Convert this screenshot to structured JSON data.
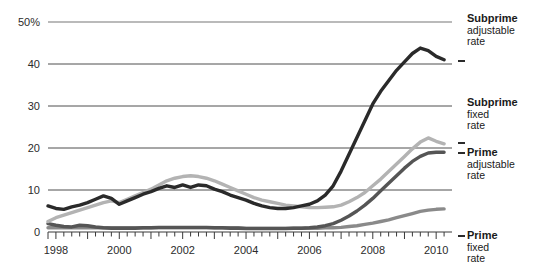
{
  "chart_data": {
    "type": "line",
    "title": "",
    "xlabel": "",
    "ylabel": "",
    "xlim": [
      1997.75,
      2010.5
    ],
    "ylim": [
      0,
      50
    ],
    "grid": true,
    "grid_axis": "y",
    "legend_position": "right",
    "y_ticks": [
      0,
      10,
      20,
      30,
      40,
      50
    ],
    "y_tick_labels": [
      "0",
      "10",
      "20",
      "30",
      "40",
      "50%"
    ],
    "x_ticks": [
      1998,
      2000,
      2002,
      2004,
      2006,
      2008,
      2010
    ],
    "x_tick_labels": [
      "1998",
      "2000",
      "2002",
      "2004",
      "2006",
      "2008",
      "2010"
    ],
    "x_minor_tick_interval": 0.25,
    "x": [
      1997.75,
      1998.0,
      1998.25,
      1998.5,
      1998.75,
      1999.0,
      1999.25,
      1999.5,
      1999.75,
      2000.0,
      2000.25,
      2000.5,
      2000.75,
      2001.0,
      2001.25,
      2001.5,
      2001.75,
      2002.0,
      2002.25,
      2002.5,
      2002.75,
      2003.0,
      2003.25,
      2003.5,
      2003.75,
      2004.0,
      2004.25,
      2004.5,
      2004.75,
      2005.0,
      2005.25,
      2005.5,
      2005.75,
      2006.0,
      2006.25,
      2006.5,
      2006.75,
      2007.0,
      2007.25,
      2007.5,
      2007.75,
      2008.0,
      2008.25,
      2008.5,
      2008.75,
      2009.0,
      2009.25,
      2009.5,
      2009.75,
      2010.0,
      2010.25
    ],
    "series": [
      {
        "name": "Subprime adjustable rate",
        "color": "#2a2a2a",
        "values": [
          6.2,
          5.6,
          5.4,
          6.0,
          6.4,
          7.0,
          7.8,
          8.6,
          8.0,
          6.6,
          7.4,
          8.2,
          9.0,
          9.6,
          10.4,
          11.0,
          10.6,
          11.2,
          10.6,
          11.2,
          11.0,
          10.2,
          9.6,
          8.8,
          8.2,
          7.6,
          6.8,
          6.2,
          5.8,
          5.6,
          5.6,
          5.8,
          6.2,
          6.6,
          7.4,
          8.8,
          11.0,
          14.5,
          18.5,
          22.5,
          26.5,
          30.5,
          33.5,
          36.0,
          38.5,
          40.5,
          42.5,
          43.8,
          43.2,
          41.8,
          41.0
        ]
      },
      {
        "name": "Subprime fixed rate",
        "color": "#b3b3b3",
        "values": [
          2.5,
          3.4,
          4.0,
          4.6,
          5.2,
          5.8,
          6.4,
          7.0,
          7.4,
          7.0,
          7.8,
          8.6,
          9.4,
          10.2,
          11.2,
          12.2,
          12.8,
          13.2,
          13.4,
          13.2,
          12.8,
          12.2,
          11.4,
          10.6,
          9.8,
          9.0,
          8.2,
          7.6,
          7.2,
          6.8,
          6.4,
          6.2,
          6.0,
          5.8,
          5.8,
          5.9,
          6.0,
          6.4,
          7.2,
          8.2,
          9.4,
          11.0,
          12.6,
          14.4,
          16.2,
          18.0,
          19.8,
          21.4,
          22.4,
          21.6,
          21.0
        ]
      },
      {
        "name": "Prime adjustable rate",
        "color": "#555555",
        "values": [
          2.0,
          1.6,
          1.3,
          1.2,
          1.6,
          1.5,
          1.2,
          1.0,
          0.9,
          0.9,
          0.9,
          0.9,
          1.0,
          1.0,
          1.1,
          1.1,
          1.1,
          1.1,
          1.1,
          1.1,
          1.1,
          1.0,
          1.0,
          0.9,
          0.9,
          0.8,
          0.8,
          0.8,
          0.8,
          0.8,
          0.8,
          0.9,
          0.9,
          1.0,
          1.2,
          1.5,
          2.0,
          2.8,
          3.8,
          5.0,
          6.4,
          8.0,
          9.8,
          11.6,
          13.4,
          15.2,
          16.8,
          18.0,
          18.8,
          19.0,
          19.0
        ]
      },
      {
        "name": "Prime fixed rate",
        "color": "#8a8a8a",
        "values": [
          1.0,
          1.0,
          1.0,
          1.0,
          1.0,
          1.0,
          1.0,
          1.0,
          1.0,
          1.0,
          1.0,
          1.0,
          1.0,
          1.0,
          1.0,
          1.0,
          1.0,
          1.0,
          1.0,
          1.0,
          1.0,
          1.0,
          1.0,
          1.0,
          1.0,
          0.9,
          0.9,
          0.9,
          0.9,
          0.9,
          0.9,
          0.9,
          0.9,
          0.9,
          0.9,
          1.0,
          1.0,
          1.1,
          1.3,
          1.5,
          1.8,
          2.1,
          2.5,
          2.9,
          3.4,
          3.9,
          4.4,
          4.9,
          5.2,
          5.4,
          5.5
        ]
      }
    ]
  },
  "legend": [
    {
      "title": "Subprime",
      "line2": "adjustable",
      "line3": "rate"
    },
    {
      "title": "Subprime",
      "line2": "fixed",
      "line3": "rate"
    },
    {
      "title": "Prime",
      "line2": "adjustable",
      "line3": "rate"
    },
    {
      "title": "Prime",
      "line2": "fixed",
      "line3": "rate"
    }
  ]
}
